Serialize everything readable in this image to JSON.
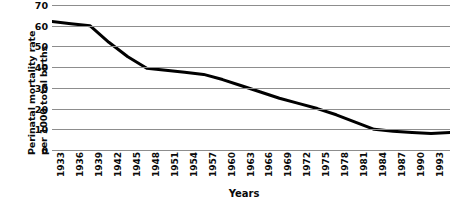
{
  "chart_data": {
    "type": "line",
    "title": "",
    "xlabel": "Years",
    "ylabel": "Perinatal mortality rate per 1000 total births",
    "ylabel_line1": "Perinatal mortality rate",
    "ylabel_line2": "per 1000 total births",
    "ylim": [
      0,
      70
    ],
    "yticks": [
      70,
      60,
      50,
      40,
      30,
      20,
      10,
      0
    ],
    "xlim": [
      1933,
      1996
    ],
    "xticks": [
      1933,
      1936,
      1939,
      1942,
      1945,
      1948,
      1951,
      1954,
      1957,
      1960,
      1963,
      1966,
      1969,
      1972,
      1975,
      1978,
      1981,
      1984,
      1987,
      1990,
      1993,
      1996
    ],
    "grid": true,
    "legend": "none",
    "line_color": "#000000",
    "grid_color": "#8d8d8d",
    "x": [
      1933,
      1936,
      1939,
      1942,
      1945,
      1948,
      1951,
      1954,
      1957,
      1960,
      1963,
      1966,
      1969,
      1972,
      1975,
      1978,
      1981,
      1984,
      1987,
      1990,
      1993,
      1996
    ],
    "values": [
      62,
      61,
      60,
      52,
      45,
      39.5,
      38.5,
      37.5,
      36.5,
      34,
      31,
      28,
      25,
      22.5,
      20,
      17,
      13.5,
      10,
      9,
      8.5,
      8,
      8.5
    ]
  }
}
